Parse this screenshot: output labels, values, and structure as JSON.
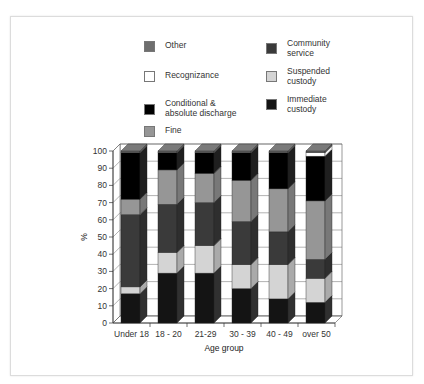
{
  "chart_data": {
    "type": "bar",
    "stacked": true,
    "three_d": true,
    "title": "",
    "xlabel": "Age group",
    "ylabel": "%",
    "ylim": [
      0,
      100
    ],
    "yticks": [
      0,
      10,
      20,
      30,
      40,
      50,
      60,
      70,
      80,
      90,
      100
    ],
    "grid": true,
    "legend_position": "top",
    "categories": [
      "Under 18",
      "18 - 20",
      "21-29",
      "30 - 39",
      "40 - 49",
      "over 50"
    ],
    "series": [
      {
        "name": "Immediate custody",
        "color": "#141414",
        "values": [
          17,
          29,
          29,
          20,
          14,
          12
        ]
      },
      {
        "name": "Suspended custody",
        "color": "#d4d4d4",
        "values": [
          4,
          12,
          16,
          14,
          20,
          14
        ]
      },
      {
        "name": "Community service",
        "color": "#3a3a3a",
        "values": [
          42,
          28,
          25,
          25,
          19,
          11
        ]
      },
      {
        "name": "Fine",
        "color": "#969696",
        "values": [
          9,
          20,
          17,
          24,
          25,
          34
        ]
      },
      {
        "name": "Conditional & absolute discharge",
        "color": "#000000",
        "values": [
          27,
          10,
          12,
          16,
          21,
          26
        ]
      },
      {
        "name": "Recognizance",
        "color": "#ffffff",
        "values": [
          0,
          0,
          0,
          0,
          0,
          2
        ]
      },
      {
        "name": "Other",
        "color": "#6e6e6e",
        "values": [
          1,
          1,
          1,
          1,
          1,
          1
        ]
      }
    ]
  },
  "legend": {
    "left": [
      {
        "label": "Other",
        "color": "#6e6e6e"
      },
      {
        "label": "Recognizance",
        "color": "#ffffff"
      },
      {
        "label": "Conditional &\nabsolute discharge",
        "color": "#000000"
      },
      {
        "label": "Fine",
        "color": "#969696"
      }
    ],
    "right": [
      {
        "label": "Community\nservice",
        "color": "#3a3a3a"
      },
      {
        "label": "Suspended\ncustody",
        "color": "#d4d4d4"
      },
      {
        "label": "Immediate\ncustody",
        "color": "#141414"
      }
    ]
  }
}
